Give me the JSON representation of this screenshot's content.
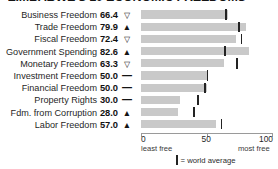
{
  "chart_data": {
    "type": "bar",
    "title": "ZIMBABWE'S 10 ECONOMIC FREEDOMS",
    "xlabel": "",
    "ylabel": "",
    "xlim": [
      0,
      100
    ],
    "grid": false,
    "orientation": "horizontal",
    "categories": [
      "Business Freedom",
      "Trade Freedom",
      "Fiscal Freedom",
      "Government Spending",
      "Monetary Freedom",
      "Investment Freedom",
      "Financial Freedom",
      "Property Rights",
      "Fdm. from Corruption",
      "Labor Freedom"
    ],
    "values": [
      66.4,
      79.9,
      72.4,
      82.6,
      63.3,
      50.0,
      50.0,
      30.0,
      28.0,
      57.0
    ],
    "value_labels": [
      "66.4",
      "79.9",
      "72.4",
      "82.6",
      "63.3",
      "50.0",
      "50.0",
      "30.0",
      "28.0",
      "57.0"
    ],
    "trends": [
      "down-triangle-hollow",
      "up-triangle-filled",
      "down-triangle-hollow",
      "up-triangle-filled",
      "down-triangle-hollow",
      "dash",
      "dash",
      "dash",
      "up-triangle-filled",
      "up-triangle-filled"
    ],
    "trend_glyphs": [
      "▽",
      "▲",
      "▽",
      "▲",
      "▽",
      "—",
      "—",
      "—",
      "▲",
      "▲"
    ],
    "series": [
      {
        "name": "Zimbabwe score",
        "values": [
          66.4,
          79.9,
          72.4,
          82.6,
          63.3,
          50.0,
          50.0,
          30.0,
          28.0,
          57.0
        ]
      },
      {
        "name": "World average",
        "values": [
          64.9,
          74.8,
          76.7,
          63.9,
          73.4,
          50.8,
          49.0,
          43.6,
          40.5,
          61.5
        ]
      }
    ],
    "axis": {
      "ticks": [
        0,
        50,
        100
      ],
      "tick_labels": [
        "0",
        "50",
        "100"
      ],
      "left_caption": "least free",
      "right_caption": "most free"
    },
    "legend": {
      "position": "bottom-center",
      "marker": "vertical-tick",
      "label": "= world average"
    },
    "colors": {
      "bar": "#c9c9c9",
      "average_tick": "#232323",
      "axis": "#9a9a9a",
      "text": "#1a1a1a",
      "background": "#ffffff"
    }
  }
}
